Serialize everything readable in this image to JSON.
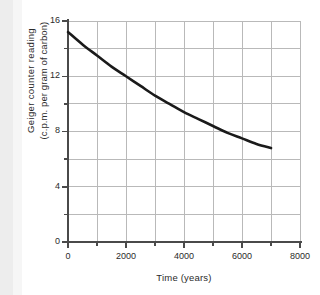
{
  "chart_data": {
    "type": "line",
    "title": "",
    "xlabel": "Time (years)",
    "ylabel": "Geiger counter  reading (c.p.m. per gram of carbon)",
    "ylabel_line1": "Geiger counter  reading",
    "ylabel_line2": "(c.p.m. per gram of carbon)",
    "xlim": [
      0,
      8000
    ],
    "ylim": [
      0,
      16
    ],
    "xticks": [
      0,
      1000,
      2000,
      3000,
      4000,
      5000,
      6000,
      7000,
      8000
    ],
    "yticks": [
      0,
      2,
      4,
      6,
      8,
      10,
      12,
      14,
      16
    ],
    "xtick_labels": [
      "0",
      "2000",
      "4000",
      "6000",
      "8000"
    ],
    "xtick_label_values": [
      0,
      2000,
      4000,
      6000,
      8000
    ],
    "ytick_labels": [
      "0",
      "4",
      "8",
      "12",
      "16"
    ],
    "ytick_label_values": [
      0,
      4,
      8,
      12,
      16
    ],
    "grid": true,
    "grid_color": "#b9b9b9",
    "legend": false,
    "legend_position": "none",
    "line_color": "#1a1a1a",
    "line_width": 2.6,
    "series": [
      {
        "name": "Geiger counter reading",
        "x": [
          0,
          500,
          1000,
          1500,
          2000,
          2500,
          3000,
          3500,
          4000,
          4500,
          5000,
          5500,
          6000,
          6500,
          7000
        ],
        "values": [
          15.2,
          14.3,
          13.5,
          12.7,
          12.0,
          11.3,
          10.6,
          10.0,
          9.4,
          8.9,
          8.4,
          7.9,
          7.5,
          7.1,
          6.8
        ]
      }
    ]
  },
  "axes_geometry": {
    "plot_left": 68,
    "plot_right": 300,
    "plot_top": 21,
    "plot_bottom": 242
  }
}
